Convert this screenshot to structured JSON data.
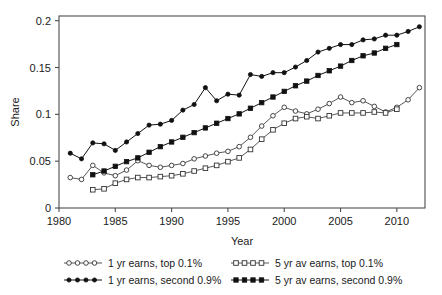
{
  "figure": {
    "background_color": "#ffffff",
    "ink_color": "#1a1a1a"
  },
  "chart_data": {
    "type": "line",
    "title": "",
    "subtitle": "",
    "xlabel": "Year",
    "ylabel": "Share",
    "xlim": [
      1980,
      2012.5
    ],
    "ylim": [
      0,
      0.205
    ],
    "grid": false,
    "legend_position": "bottom",
    "legend_columns": 2,
    "x_ticks": [
      1980,
      1985,
      1990,
      1995,
      2000,
      2005,
      2010
    ],
    "x_tick_labels": [
      "1980",
      "1985",
      "1990",
      "1995",
      "2000",
      "2005",
      "2010"
    ],
    "y_ticks": [
      0,
      0.05,
      0.1,
      0.15,
      0.2
    ],
    "y_tick_labels": [
      "0",
      "0.05",
      "0.1",
      "0.15",
      "0.2"
    ],
    "series": [
      {
        "name": "1 yr earns, top 0.1%",
        "marker": "open-circle",
        "line": "thin",
        "color": "#333333",
        "x": [
          1981,
          1982,
          1983,
          1984,
          1985,
          1986,
          1987,
          1988,
          1989,
          1990,
          1991,
          1992,
          1993,
          1994,
          1995,
          1996,
          1997,
          1998,
          1999,
          2000,
          2001,
          2002,
          2003,
          2004,
          2005,
          2006,
          2007,
          2008,
          2009,
          2010,
          2011,
          2012
        ],
        "y": [
          0.0325,
          0.0305,
          0.0455,
          0.0375,
          0.0345,
          0.0405,
          0.0505,
          0.0455,
          0.0435,
          0.0455,
          0.0475,
          0.0525,
          0.0555,
          0.0585,
          0.0605,
          0.0655,
          0.0755,
          0.0875,
          0.0985,
          0.1075,
          0.1035,
          0.1005,
          0.1055,
          0.1115,
          0.1185,
          0.1125,
          0.1145,
          0.1085,
          0.1025,
          0.1075,
          0.1155,
          0.1285
        ]
      },
      {
        "name": "5 yr av earns, top 0.1%",
        "marker": "open-square",
        "line": "thin",
        "color": "#333333",
        "x": [
          1983,
          1984,
          1985,
          1986,
          1987,
          1988,
          1989,
          1990,
          1991,
          1992,
          1993,
          1994,
          1995,
          1996,
          1997,
          1998,
          1999,
          2000,
          2001,
          2002,
          2003,
          2004,
          2005,
          2006,
          2007,
          2008,
          2009,
          2010
        ],
        "y": [
          0.0195,
          0.0205,
          0.0265,
          0.0305,
          0.0325,
          0.0325,
          0.0335,
          0.0345,
          0.0365,
          0.0395,
          0.0425,
          0.0455,
          0.0495,
          0.0535,
          0.0625,
          0.0735,
          0.0835,
          0.0905,
          0.0955,
          0.0975,
          0.0955,
          0.0985,
          0.1015,
          0.1015,
          0.1015,
          0.1025,
          0.1015,
          0.1055
        ]
      },
      {
        "name": "1 yr earns, second 0.9%",
        "marker": "solid-circle",
        "line": "normal",
        "color": "#111111",
        "x": [
          1981,
          1982,
          1983,
          1984,
          1985,
          1986,
          1987,
          1988,
          1989,
          1990,
          1991,
          1992,
          1993,
          1994,
          1995,
          1996,
          1997,
          1998,
          1999,
          2000,
          2001,
          2002,
          2003,
          2004,
          2005,
          2006,
          2007,
          2008,
          2009,
          2010,
          2011,
          2012
        ],
        "y": [
          0.0585,
          0.0525,
          0.0695,
          0.0685,
          0.0615,
          0.0705,
          0.0795,
          0.0885,
          0.0895,
          0.0935,
          0.1045,
          0.1105,
          0.1285,
          0.1145,
          0.1215,
          0.1205,
          0.1425,
          0.1405,
          0.1445,
          0.1445,
          0.1505,
          0.1575,
          0.1665,
          0.1705,
          0.1745,
          0.1745,
          0.1795,
          0.1805,
          0.1845,
          0.1845,
          0.1885,
          0.1935
        ]
      },
      {
        "name": "5 yr av earns, second 0.9%",
        "marker": "solid-square",
        "line": "normal",
        "color": "#111111",
        "x": [
          1983,
          1984,
          1985,
          1986,
          1987,
          1988,
          1989,
          1990,
          1991,
          1992,
          1993,
          1994,
          1995,
          1996,
          1997,
          1998,
          1999,
          2000,
          2001,
          2002,
          2003,
          2004,
          2005,
          2006,
          2007,
          2008,
          2009,
          2010
        ],
        "y": [
          0.0355,
          0.0395,
          0.0445,
          0.0495,
          0.0535,
          0.0595,
          0.0655,
          0.0705,
          0.0755,
          0.0805,
          0.0855,
          0.0905,
          0.0955,
          0.1005,
          0.1065,
          0.1125,
          0.1185,
          0.1245,
          0.1305,
          0.1355,
          0.1415,
          0.1465,
          0.1515,
          0.1575,
          0.1625,
          0.1655,
          0.1705,
          0.1745
        ]
      }
    ]
  },
  "legend": {
    "entries": [
      {
        "label": "1 yr earns, top 0.1%",
        "marker": "open-circle"
      },
      {
        "label": "5 yr av earns, top 0.1%",
        "marker": "open-square"
      },
      {
        "label": "1 yr earns, second 0.9%",
        "marker": "solid-circle"
      },
      {
        "label": "5 yr av earns, second 0.9%",
        "marker": "solid-square"
      }
    ]
  }
}
